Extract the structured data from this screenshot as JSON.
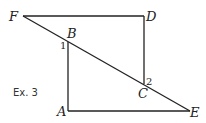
{
  "diagram": {
    "caption": "Ex. 3",
    "points": {
      "F": {
        "label": "F",
        "x": 23,
        "y": 16
      },
      "D": {
        "label": "D",
        "x": 144,
        "y": 16
      },
      "B": {
        "label": "B",
        "x": 68,
        "y": 42
      },
      "C": {
        "label": "C",
        "x": 144,
        "y": 84
      },
      "A": {
        "label": "A",
        "x": 68,
        "y": 111
      },
      "E": {
        "label": "E",
        "x": 190,
        "y": 111
      }
    },
    "angles": [
      {
        "label": "1",
        "at": "B"
      },
      {
        "label": "2",
        "at": "C"
      }
    ],
    "segments": [
      "FD",
      "DC",
      "FE",
      "BA",
      "AE"
    ],
    "stroke_color": "#222222"
  }
}
